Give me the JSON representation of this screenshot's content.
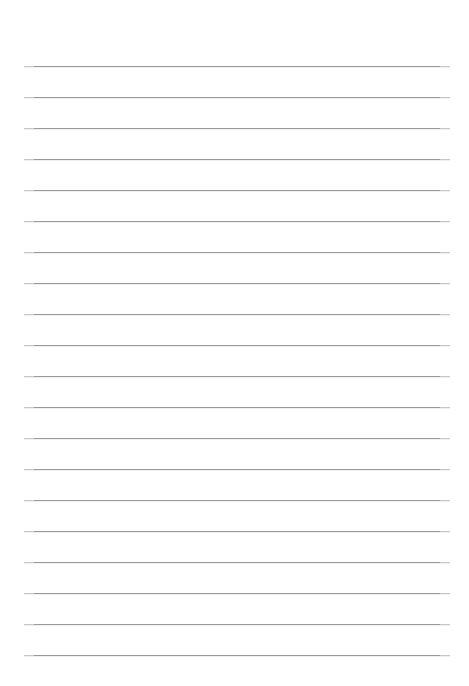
{
  "document": {
    "type": "lined-paper",
    "title": "Blank ruled notebook page",
    "background_color": "#ffffff",
    "page_width": 469,
    "page_height": 686,
    "text_content": "",
    "has_text": false,
    "has_margin_rule": false,
    "has_header": false,
    "has_footer": false
  },
  "ruling": {
    "line_color": "#9a9a9a",
    "line_thickness_px": 1,
    "line_count": 20,
    "left_x": 24,
    "right_x": 450,
    "line_length_px": 426,
    "first_line_y": 66,
    "last_line_y": 655,
    "line_spacing_px": 31,
    "top_margin_px": 66,
    "bottom_margin_px": 31,
    "left_margin_px": 24,
    "right_margin_px": 19,
    "line_y_positions": [
      66,
      97,
      128,
      159,
      190,
      221,
      252,
      283,
      314,
      345,
      376,
      407,
      438,
      469,
      500,
      531,
      562,
      593,
      624,
      655
    ]
  }
}
